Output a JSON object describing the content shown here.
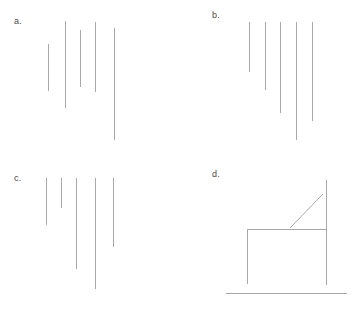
{
  "figure": {
    "width": 355,
    "height": 312,
    "background_color": "#ffffff",
    "line_color": "#a8a8a8",
    "label_color": "#4a4a4a",
    "panel_count": 4,
    "layout": "2x2 grid of line-drawing panels"
  },
  "panels": [
    {
      "id": "a",
      "label": "a.",
      "label_x": 14,
      "label_y": 17,
      "origin_x": 0,
      "origin_y": 0,
      "description": "Five vertical lines with staggered tops and staggered bottoms",
      "lines": [
        {
          "name": "line-1",
          "x1": 48,
          "y1": 44,
          "x2": 48,
          "y2": 91
        },
        {
          "name": "line-2",
          "x1": 65,
          "y1": 21,
          "x2": 65,
          "y2": 108
        },
        {
          "name": "line-3",
          "x1": 80,
          "y1": 30,
          "x2": 80,
          "y2": 87
        },
        {
          "name": "line-4",
          "x1": 95,
          "y1": 22,
          "x2": 95,
          "y2": 92
        },
        {
          "name": "line-5",
          "x1": 114,
          "y1": 28,
          "x2": 114,
          "y2": 140
        }
      ]
    },
    {
      "id": "b",
      "label": "b.",
      "label_x": 34,
      "label_y": 11,
      "origin_x": 178,
      "origin_y": 0,
      "description": "Five vertical lines aligned at a common top edge, increasing in length left to right",
      "lines": [
        {
          "name": "line-1",
          "x1": 71,
          "y1": 22,
          "x2": 71,
          "y2": 72
        },
        {
          "name": "line-2",
          "x1": 87,
          "y1": 22,
          "x2": 87,
          "y2": 90
        },
        {
          "name": "line-3",
          "x1": 102,
          "y1": 22,
          "x2": 102,
          "y2": 113
        },
        {
          "name": "line-4",
          "x1": 118,
          "y1": 22,
          "x2": 118,
          "y2": 140
        },
        {
          "name": "line-5",
          "x1": 134,
          "y1": 22,
          "x2": 134,
          "y2": 121
        }
      ]
    },
    {
      "id": "c",
      "label": "c.",
      "label_x": 14,
      "label_y": 18,
      "origin_x": 0,
      "origin_y": 156,
      "description": "Five vertical lines aligned at a common top edge with irregular bottom ends",
      "lines": [
        {
          "name": "line-1",
          "x1": 46,
          "y1": 22,
          "x2": 46,
          "y2": 69
        },
        {
          "name": "line-2",
          "x1": 61,
          "y1": 22,
          "x2": 61,
          "y2": 52
        },
        {
          "name": "line-3",
          "x1": 76,
          "y1": 22,
          "x2": 76,
          "y2": 113
        },
        {
          "name": "line-4",
          "x1": 95,
          "y1": 22,
          "x2": 95,
          "y2": 133
        },
        {
          "name": "line-5",
          "x1": 113,
          "y1": 22,
          "x2": 113,
          "y2": 91
        }
      ]
    },
    {
      "id": "d",
      "label": "d.",
      "label_x": 34,
      "label_y": 14,
      "origin_x": 178,
      "origin_y": 156,
      "description": "Open box figure: left vertical, right vertical, upper horizontal crossbar, a diagonal stroke, and a long lower baseline",
      "lines": [
        {
          "name": "left-vertical",
          "x1": 69,
          "y1": 73,
          "x2": 69,
          "y2": 128
        },
        {
          "name": "upper-horizontal",
          "x1": 69,
          "y1": 73,
          "x2": 148,
          "y2": 73
        },
        {
          "name": "right-vertical",
          "x1": 148,
          "y1": 24,
          "x2": 148,
          "y2": 129
        },
        {
          "name": "bottom-baseline",
          "x1": 48,
          "y1": 137,
          "x2": 169,
          "y2": 137
        }
      ],
      "diagonals": [
        {
          "name": "diagonal-stroke",
          "x1": 112,
          "y1": 72,
          "x2": 145,
          "y2": 38
        }
      ]
    }
  ]
}
